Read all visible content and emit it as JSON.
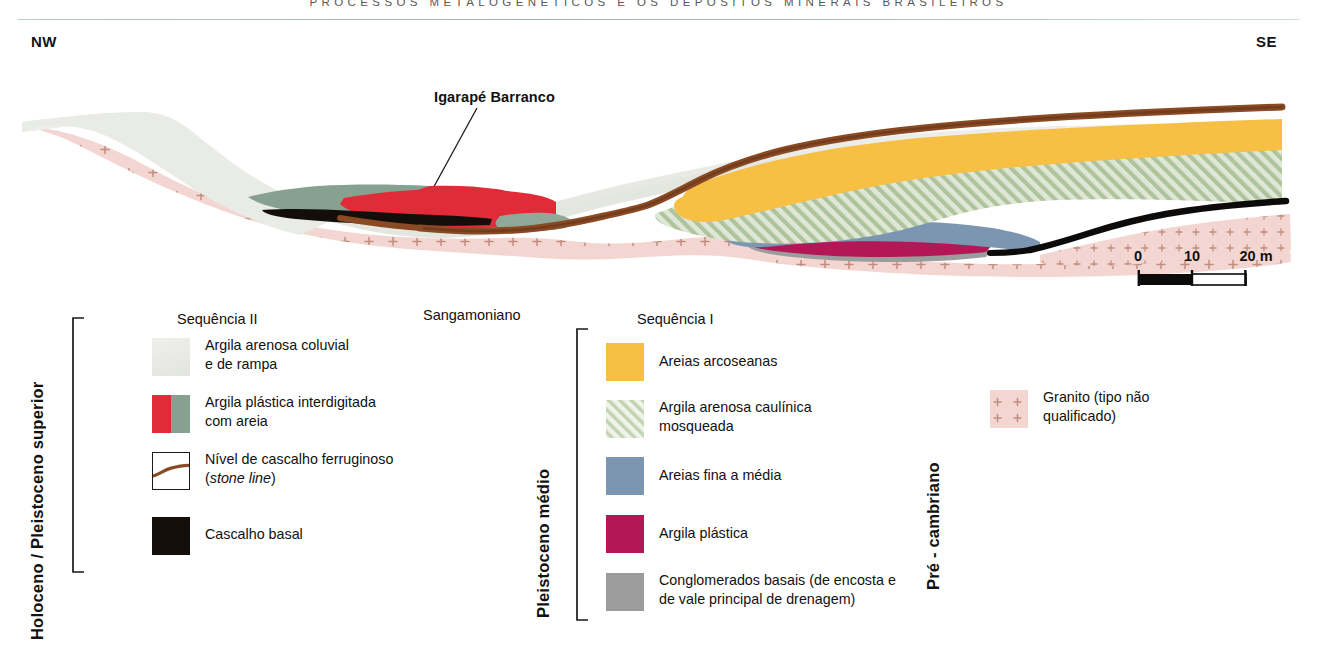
{
  "running_head": "PROCESSOS METALOGENÉTICOS E OS DEPÓSITOS MINERAIS BRASILEIROS",
  "orientation": {
    "left": "NW",
    "right": "SE"
  },
  "annotations": {
    "stream_label": "Igarapé Barranco"
  },
  "scale": {
    "ticks": [
      "0",
      "10",
      "20 m"
    ],
    "values": [
      0,
      10,
      20
    ],
    "unit": "m"
  },
  "epochs": {
    "upper": "Holoceno / Pleistoceno superior",
    "middle": "Pleistoceno médio",
    "basement": "Pré - cambriano",
    "interval": "Sangamoniano"
  },
  "legend": {
    "sequence_two": {
      "title": "Sequência II",
      "items": [
        {
          "label": "Argila arenosa coluvial\ne de rampa",
          "swatch": "colluvial-clay-swatch",
          "color": "#E8E9E4"
        },
        {
          "label": "Argila plástica interdigitada\ncom areia",
          "swatch": "plastic-clay-sand-swatch",
          "color": "#E22B38",
          "color_secondary": "#86A190"
        },
        {
          "label": "Nível de cascalho ferruginoso\n(stone line)",
          "swatch": "stone-line-swatch",
          "color": "#8A4A24"
        },
        {
          "label": "Cascalho basal",
          "swatch": "basal-gravel-swatch",
          "color": "#140E0B"
        }
      ]
    },
    "sequence_one": {
      "title": "Sequência I",
      "items": [
        {
          "label": "Areias arcoseanas",
          "swatch": "arkosic-sand-swatch",
          "color": "#F7BF43"
        },
        {
          "label": "Argila arenosa caulínica\nmosqueada",
          "swatch": "kaolinitic-clay-swatch",
          "color": "#CBDCC2"
        },
        {
          "label": "Areias fina a média",
          "swatch": "fine-medium-sand-swatch",
          "color": "#7C96B2"
        },
        {
          "label": "Argila plástica",
          "swatch": "plastic-clay-swatch",
          "color": "#B31756"
        },
        {
          "label": "Conglomerados basais (de encosta e\nde vale principal de drenagem)",
          "swatch": "basal-conglomerate-swatch",
          "color": "#9C9C9C"
        }
      ]
    },
    "basement": {
      "items": [
        {
          "label": "Granito (tipo não\nqualificado)",
          "swatch": "granite-swatch",
          "color": "#F3D6D1"
        }
      ]
    }
  },
  "cross_section": {
    "units": [
      "granite-basement",
      "colluvial-clay",
      "plastic-clay-interdigitated",
      "basal-gravel",
      "stone-line",
      "arkosic-sand",
      "kaolinitic-mottled-clay",
      "fine-medium-sand",
      "plastic-clay",
      "basal-conglomerate"
    ]
  }
}
